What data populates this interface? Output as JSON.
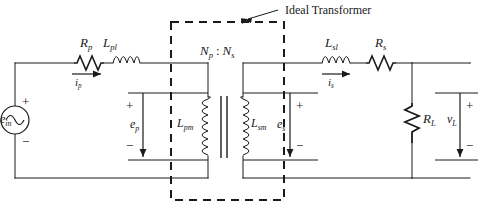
{
  "diagram": {
    "title_annotation": "Ideal Transformer",
    "stroke_color": "#1a1a1a",
    "background_color": "#ffffff"
  },
  "components": {
    "source": {
      "name": "voltage-source",
      "label": "e",
      "subscript": "in",
      "plus": "+",
      "minus": "−"
    },
    "primary_resistor": {
      "label": "R",
      "subscript": "p"
    },
    "primary_leakage_inductor": {
      "label": "L",
      "subscript": "pl"
    },
    "primary_magnetizing_inductor": {
      "label": "L",
      "subscript": "pm"
    },
    "secondary_magnetizing_inductor": {
      "label": "L",
      "subscript": "sm"
    },
    "secondary_leakage_inductor": {
      "label": "L",
      "subscript": "sl"
    },
    "secondary_resistor": {
      "label": "R",
      "subscript": "s"
    },
    "load_resistor": {
      "label": "R",
      "subscript": "L"
    }
  },
  "currents": {
    "primary": {
      "label": "i",
      "subscript": "p"
    },
    "secondary": {
      "label": "i",
      "subscript": "s"
    }
  },
  "voltages": {
    "primary_emf": {
      "label": "e",
      "subscript": "p",
      "plus": "+",
      "minus": "−"
    },
    "secondary_emf": {
      "label": "e",
      "subscript": "s",
      "plus": "+",
      "minus": "−"
    },
    "load": {
      "label": "v",
      "subscript": "L",
      "plus": "+",
      "minus": "−"
    },
    "source_plus": "+",
    "source_minus": "−"
  },
  "turns_ratio": {
    "primary_symbol": "N",
    "primary_subscript": "p",
    "separator": ":",
    "secondary_symbol": "N",
    "secondary_subscript": "s",
    "full": "N p : N s"
  }
}
